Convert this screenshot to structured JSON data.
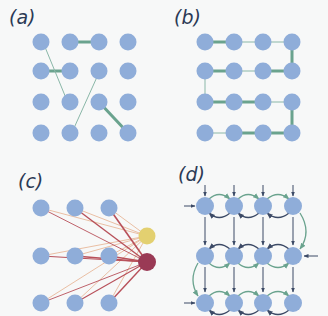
{
  "colors": {
    "background": "#f7f8f8",
    "node": "#8fadd9",
    "edge_green": "#6aa38e",
    "edge_thin": "#8ab7a8",
    "arrow": "#3c4a66",
    "yellow_node": "#e3d070",
    "maroon_node": "#9a3a55",
    "edge_red": "#b8505a",
    "edge_peach": "#e8b89a"
  },
  "panels": [
    {
      "id": "a",
      "label": "(a)",
      "description": "4x4 grid with sparse random connections"
    },
    {
      "id": "b",
      "label": "(b)",
      "description": "4x4 grid with serpentine chain path"
    },
    {
      "id": "c",
      "label": "(c)",
      "description": "3x3 grid fully connected to two output nodes (yellow and maroon)"
    },
    {
      "id": "d",
      "label": "(d)",
      "description": "4x3 grid with bidirectional curved horizontal links, vertical arrows and input arrows"
    }
  ]
}
